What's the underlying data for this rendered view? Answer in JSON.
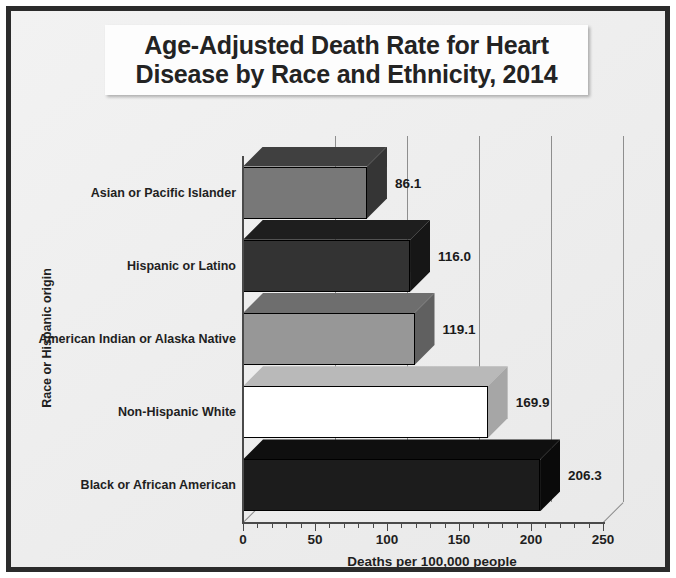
{
  "chart_data": {
    "type": "bar",
    "orientation": "horizontal",
    "three_d": true,
    "title": "Age-Adjusted Death Rate for Heart Disease by Race and Ethnicity, 2014",
    "title_line1": "Age-Adjusted Death Rate for Heart",
    "title_line2": "Disease by Race and Ethnicity, 2014",
    "xlabel": "Deaths per 100,000 people",
    "ylabel": "Race or Hispanic origin",
    "xlim": [
      0,
      250
    ],
    "xtick_labels": [
      "0",
      "50",
      "100",
      "150",
      "200",
      "250"
    ],
    "xtick_values": [
      0,
      50,
      100,
      150,
      200,
      250
    ],
    "minor_tick_interval": 10,
    "grid": "vertical-major",
    "legend": "none",
    "categories": [
      "Asian or Pacific Islander",
      "Hispanic or Latino",
      "American Indian or Alaska Native",
      "Non-Hispanic White",
      "Black or African American"
    ],
    "values": [
      86.1,
      116.0,
      119.1,
      169.9,
      206.3
    ],
    "value_labels": [
      "86.1",
      "116.0",
      "119.1",
      "169.9",
      "206.3"
    ],
    "bar_colors": [
      "#787878",
      "#333333",
      "#979797",
      "#ffffff",
      "#1c1c1c"
    ],
    "bar_top_colors": [
      "#404040",
      "#1e1e1e",
      "#6e6e6e",
      "#b9b9b9",
      "#0f0f0f"
    ],
    "bar_side_colors": [
      "#353535",
      "#161616",
      "#606060",
      "#a6a6a6",
      "#0a0a0a"
    ]
  },
  "style": {
    "frame_border_color": "#2b2b2b",
    "background_color": "#f0f0f0",
    "title_box_color": "#fdfdfd",
    "axis_color": "#4a4a4a",
    "grid_color": "#8e8e8e",
    "text_color": "#1f1f1f"
  }
}
